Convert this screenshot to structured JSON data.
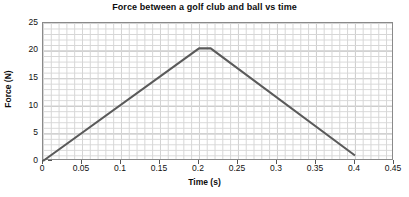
{
  "chart_data": {
    "type": "line",
    "title": "Force between a golf club and ball vs time",
    "xlabel": "Time (s)",
    "ylabel": "Force (N)",
    "xlim": [
      0,
      0.45
    ],
    "ylim": [
      0,
      25
    ],
    "grid": "major and minor gridlines shown",
    "legend": "none",
    "line_color": "#5a5a5a",
    "x_ticks": [
      "0",
      "0.05",
      "0.1",
      "0.15",
      "0.2",
      "0.25",
      "0.3",
      "0.35",
      "0.4",
      "0.45"
    ],
    "x_tick_values": [
      0,
      0.05,
      0.1,
      0.15,
      0.2,
      0.25,
      0.3,
      0.35,
      0.4,
      0.45
    ],
    "y_ticks": [
      "0",
      "5",
      "10",
      "15",
      "20",
      "25"
    ],
    "y_tick_values": [
      0,
      5,
      10,
      15,
      20,
      25
    ],
    "x": [
      0,
      0.2,
      0.215,
      0.4
    ],
    "values": [
      0,
      20.4,
      20.4,
      1.0
    ],
    "series": [
      {
        "name": "Force",
        "points": [
          {
            "x": 0,
            "y": 0
          },
          {
            "x": 0.2,
            "y": 20.4
          },
          {
            "x": 0.215,
            "y": 20.4
          },
          {
            "x": 0.4,
            "y": 1.0
          }
        ]
      }
    ],
    "annotations": []
  }
}
